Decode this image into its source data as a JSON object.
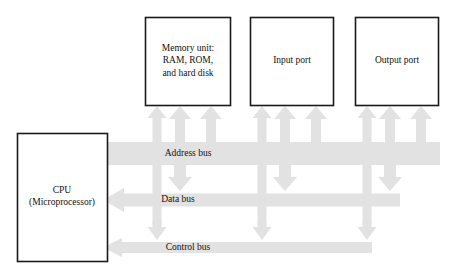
{
  "diagram": {
    "colors": {
      "bus_fill": "#e2e2e2",
      "box_stroke": "#1a1a1a",
      "box_fill": "#ffffff",
      "text": "#111111",
      "background": "#ffffff"
    }
  },
  "boxes": {
    "memory": {
      "line1": "Memory unit:",
      "line2": "RAM, ROM,",
      "line3": "and hard disk"
    },
    "input_port": {
      "label": "Input port"
    },
    "output_port": {
      "label": "Output port"
    },
    "cpu": {
      "line1": "CPU",
      "line2": "(Microprocessor)"
    }
  },
  "buses": [
    {
      "id": "address-bus",
      "label": "Address bus",
      "direction": "right",
      "arrowheads": "none"
    },
    {
      "id": "data-bus",
      "label": "Data bus",
      "direction": "left",
      "arrowheads": "left"
    },
    {
      "id": "control-bus",
      "label": "Control bus",
      "direction": "left",
      "arrowheads": "left"
    }
  ],
  "connectors": {
    "up_arrow_columns": 3,
    "device_groups": [
      "memory",
      "input_port",
      "output_port"
    ],
    "down_arrow_to_data_bus": true,
    "down_arrow_to_control_bus": true
  }
}
